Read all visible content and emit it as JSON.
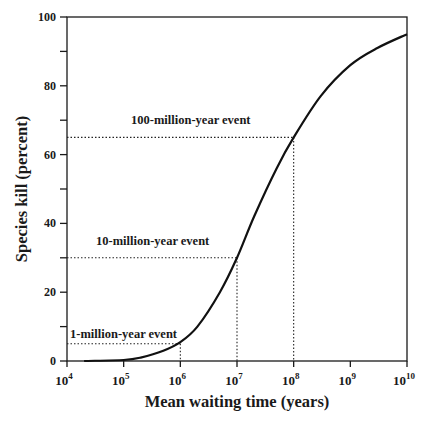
{
  "chart_data": {
    "type": "line",
    "title": "",
    "xlabel": "Mean waiting time (years)",
    "ylabel": "Species kill (percent)",
    "x_scale": "log",
    "xlim": [
      10000,
      10000000000
    ],
    "ylim": [
      0,
      100
    ],
    "grid": false,
    "legend": null,
    "x_ticks": [
      {
        "base": "10",
        "exp": "4"
      },
      {
        "base": "10",
        "exp": "5"
      },
      {
        "base": "10",
        "exp": "6"
      },
      {
        "base": "10",
        "exp": "7"
      },
      {
        "base": "10",
        "exp": "8"
      },
      {
        "base": "10",
        "exp": "9"
      },
      {
        "base": "10",
        "exp": "10"
      }
    ],
    "y_ticks": [
      "0",
      "20",
      "40",
      "60",
      "80",
      "100"
    ],
    "y_minor_ticks": [
      10,
      30,
      50,
      70,
      90
    ],
    "series": [
      {
        "name": "Kill curve",
        "x": [
          20000,
          100000,
          200000,
          500000,
          1000000,
          2000000,
          5000000,
          10000000,
          20000000,
          50000000,
          100000000,
          300000000,
          1000000000,
          3000000000,
          10000000000
        ],
        "y": [
          0,
          0.3,
          1,
          3,
          5.5,
          10,
          20,
          30,
          42,
          56,
          65,
          77,
          86,
          91,
          95
        ]
      }
    ],
    "annotations": [
      {
        "label": "1-million-year event",
        "x": 1000000,
        "y": 5
      },
      {
        "label": "10-million-year event",
        "x": 10000000,
        "y": 30
      },
      {
        "label": "100-million-year event",
        "x": 100000000,
        "y": 65
      }
    ]
  }
}
